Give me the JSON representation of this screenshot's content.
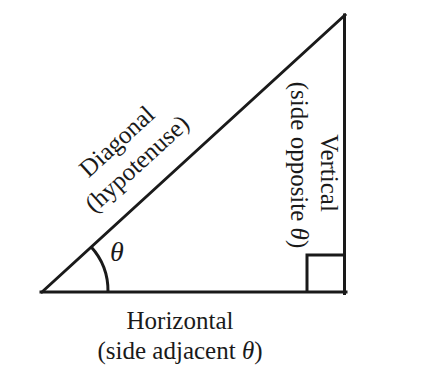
{
  "figure": {
    "background_color": "#ffffff",
    "stroke_color": "#1a1a1a",
    "stroke_width": 3,
    "geometry": {
      "vertex_left": [
        42,
        292
      ],
      "vertex_top": [
        345,
        15
      ],
      "vertex_right_angle": [
        345,
        293
      ],
      "hypotenuse_angle_degrees": 42.4,
      "angle_arc_radius": 66,
      "right_angle_square_size": 38
    },
    "labels": {
      "angle_symbol": "θ",
      "horizontal": {
        "line1": "Horizontal",
        "line2_prefix": "(side adjacent ",
        "line2_symbol": "θ",
        "line2_suffix": ")"
      },
      "vertical": {
        "line1": "Vertical",
        "line2_prefix": "(side opposite ",
        "line2_symbol": "θ",
        "line2_suffix": ")"
      },
      "diagonal": {
        "line1": "Diagonal",
        "line2": "(hypotenuse)"
      }
    }
  }
}
